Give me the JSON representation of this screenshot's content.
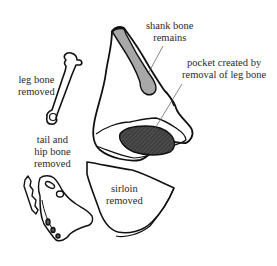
{
  "diagram": {
    "labels": {
      "shank_bone": [
        "shank bone",
        "remains"
      ],
      "pocket": [
        "pocket created by",
        "removal of leg bone"
      ],
      "leg_bone": [
        "leg bone",
        "removed"
      ],
      "tail_hip": [
        "tail and",
        "hip bone",
        "removed"
      ],
      "sirloin": [
        "sirloin",
        "removed"
      ]
    },
    "colors": {
      "outline": "#111111",
      "shank_bone_fill": "#a8a8a8",
      "pocket_fill": "#4a4a4a",
      "background": "#ffffff",
      "leader_line": "#555555"
    }
  }
}
